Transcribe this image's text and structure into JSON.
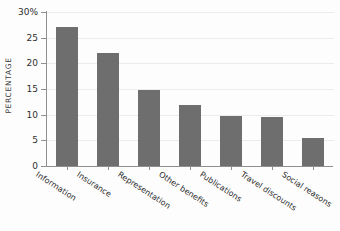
{
  "chart_data": {
    "type": "bar",
    "title": "",
    "subtitle": "",
    "xlabel": "",
    "ylabel": "PERCENTAGE",
    "ylim": [
      0,
      30
    ],
    "grid": true,
    "legend": false,
    "legend_position": "none",
    "bar_color": "#6e6e6e",
    "axis_color": "#8f8f8f",
    "gridline_color": "#ececec",
    "y_ticks": [
      {
        "value": 30,
        "label": "30%"
      },
      {
        "value": 25,
        "label": "25"
      },
      {
        "value": 20,
        "label": "20"
      },
      {
        "value": 15,
        "label": "15"
      },
      {
        "value": 10,
        "label": "10"
      },
      {
        "value": 5,
        "label": "5"
      },
      {
        "value": 0,
        "label": "0"
      }
    ],
    "categories": [
      "Information",
      "Insurance",
      "Representation",
      "Other benefits",
      "Publications",
      "Travel discounts",
      "Social reasons"
    ],
    "values": [
      27,
      22,
      14.8,
      11.8,
      9.8,
      9.6,
      5.5
    ]
  }
}
